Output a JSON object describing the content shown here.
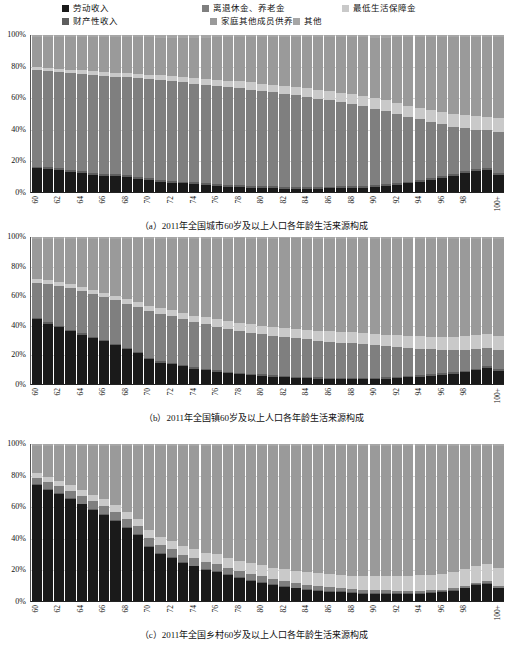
{
  "legend": {
    "items": [
      {
        "label": "劳动收入",
        "color": "#1a1a1a",
        "key": "labor"
      },
      {
        "label": "财产性收入",
        "color": "#5e5e5e",
        "key": "property"
      },
      {
        "label": "离退休金、养老金",
        "color": "#7f7f7f",
        "key": "pension"
      },
      {
        "label": "家庭其他成员供养",
        "color": "#9a9a9a",
        "key": "family"
      },
      {
        "label": "最低生活保障金",
        "color": "#c9c9c9",
        "key": "subsistence"
      },
      {
        "label": "其他",
        "color": "#a6a6a6",
        "key": "other"
      }
    ]
  },
  "axis": {
    "y_ticks": [
      "0%",
      "20%",
      "40%",
      "60%",
      "80%",
      "100%"
    ],
    "y_values": [
      0,
      20,
      40,
      60,
      80,
      100
    ],
    "x_ticks": [
      "60",
      "",
      "62",
      "",
      "64",
      "",
      "66",
      "",
      "68",
      "",
      "70",
      "",
      "72",
      "",
      "74",
      "",
      "76",
      "",
      "78",
      "",
      "80",
      "",
      "82",
      "",
      "84",
      "",
      "86",
      "",
      "88",
      "",
      "90",
      "",
      "92",
      "",
      "94",
      "",
      "96",
      "",
      "98",
      "",
      "",
      "100+"
    ]
  },
  "captions": {
    "a": "（a）2011年全国城市60岁及以上人口各年龄生活来源构成",
    "b": "（b）2011年全国镇60岁及以上人口各年龄生活来源构成",
    "c": "（c）2011年全国乡村60岁及以上人口各年龄生活来源构成"
  },
  "chart_data": [
    {
      "id": "a",
      "type": "bar",
      "stacked": true,
      "title": "（a）2011年全国城市60岁及以上人口各年龄生活来源构成",
      "xlabel": "",
      "ylabel": "",
      "ylim": [
        0,
        100
      ],
      "grid": true,
      "legend_position": "top",
      "categories": [
        "60",
        "61",
        "62",
        "63",
        "64",
        "65",
        "66",
        "67",
        "68",
        "69",
        "70",
        "71",
        "72",
        "73",
        "74",
        "75",
        "76",
        "77",
        "78",
        "79",
        "80",
        "81",
        "82",
        "83",
        "84",
        "85",
        "86",
        "87",
        "88",
        "89",
        "90",
        "91",
        "92",
        "93",
        "94",
        "95",
        "96",
        "97",
        "98",
        "99",
        "100",
        "100+"
      ],
      "series": [
        {
          "name": "劳动收入",
          "color": "#1a1a1a",
          "values": [
            15,
            14.5,
            14,
            13,
            12,
            11,
            10.5,
            10,
            9.5,
            8.5,
            7.5,
            6.5,
            6,
            5.5,
            5,
            4.5,
            4,
            3.5,
            3,
            2.8,
            2.6,
            2.4,
            2.2,
            2.2,
            2.2,
            2.2,
            2.3,
            2.5,
            2.6,
            2.8,
            3.2,
            3.8,
            4.5,
            5.5,
            6.5,
            7.5,
            9,
            10.5,
            12,
            13.5,
            14,
            11
          ]
        },
        {
          "name": "财产性收入",
          "color": "#5e5e5e",
          "values": [
            1.2,
            1.2,
            1.2,
            1.2,
            1.2,
            1.2,
            1.2,
            1.2,
            1.2,
            1.2,
            1.2,
            1.2,
            1.2,
            1.2,
            1.2,
            1.2,
            1.2,
            1.2,
            1.2,
            1.2,
            1.2,
            1.2,
            1.2,
            1.2,
            1.2,
            1.2,
            1.2,
            1.2,
            1.2,
            1.2,
            1.2,
            1.2,
            1.2,
            1.2,
            1.2,
            1.2,
            1.2,
            1.2,
            1.2,
            1.2,
            1.2,
            1.2
          ]
        },
        {
          "name": "离退休金、养老金",
          "color": "#7f7f7f",
          "values": [
            61.3,
            61.3,
            61.1,
            61.6,
            62.1,
            62.6,
            62.3,
            62.3,
            62.3,
            62.8,
            63.3,
            63.8,
            63.4,
            63.1,
            62.8,
            62.5,
            62.3,
            62.1,
            61.9,
            61.2,
            60.5,
            59.8,
            59.1,
            58.1,
            57.1,
            56.1,
            55.0,
            53.5,
            52.2,
            50.8,
            48.8,
            46.5,
            44.0,
            41.0,
            38.5,
            36.0,
            33.0,
            30.0,
            27.5,
            25.0,
            24.0,
            26.0
          ]
        },
        {
          "name": "最低生活保障金",
          "color": "#c9c9c9",
          "values": [
            2.0,
            2.0,
            2.2,
            2.2,
            2.2,
            2.2,
            2.4,
            2.5,
            2.6,
            2.7,
            2.8,
            3.0,
            3.2,
            3.4,
            3.6,
            3.8,
            4.0,
            4.2,
            4.4,
            4.6,
            4.8,
            5.0,
            5.2,
            5.4,
            5.6,
            5.8,
            6.0,
            6.2,
            6.4,
            6.6,
            6.8,
            7.0,
            7.2,
            7.4,
            7.6,
            7.8,
            8.0,
            8.2,
            8.4,
            8.6,
            8.8,
            9.0
          ]
        },
        {
          "name": "家庭其他成员供养",
          "color": "#9a9a9a",
          "values": [
            19.0,
            19.5,
            20.0,
            20.5,
            21.0,
            21.5,
            22.1,
            22.5,
            23.0,
            23.3,
            23.7,
            23.9,
            24.6,
            25.2,
            25.8,
            26.4,
            27.0,
            27.5,
            28.0,
            29.0,
            29.6,
            30.2,
            30.8,
            31.6,
            32.4,
            33.2,
            34.0,
            35.1,
            36.1,
            37.1,
            38.4,
            39.9,
            41.6,
            43.4,
            44.9,
            46.4,
            47.7,
            49.0,
            49.8,
            50.6,
            51.0,
            51.8
          ]
        },
        {
          "name": "其他",
          "color": "#a6a6a6",
          "values": [
            1.5,
            1.5,
            1.5,
            1.5,
            1.5,
            1.5,
            1.5,
            1.5,
            1.4,
            1.5,
            1.5,
            1.6,
            1.6,
            1.6,
            1.6,
            1.6,
            1.5,
            1.5,
            1.5,
            1.2,
            1.3,
            1.4,
            1.5,
            1.5,
            1.5,
            1.5,
            1.5,
            1.5,
            1.5,
            1.5,
            1.6,
            1.6,
            1.5,
            1.5,
            1.3,
            1.1,
            1.1,
            1.1,
            1.1,
            1.1,
            1.0,
            1.0
          ]
        }
      ]
    },
    {
      "id": "b",
      "type": "bar",
      "stacked": true,
      "title": "（b）2011年全国镇60岁及以上人口各年龄生活来源构成",
      "xlabel": "",
      "ylabel": "",
      "ylim": [
        0,
        100
      ],
      "grid": true,
      "legend_position": "top",
      "categories": [
        "60",
        "61",
        "62",
        "63",
        "64",
        "65",
        "66",
        "67",
        "68",
        "69",
        "70",
        "71",
        "72",
        "73",
        "74",
        "75",
        "76",
        "77",
        "78",
        "79",
        "80",
        "81",
        "82",
        "83",
        "84",
        "85",
        "86",
        "87",
        "88",
        "89",
        "90",
        "91",
        "92",
        "93",
        "94",
        "95",
        "96",
        "97",
        "98",
        "99",
        "100",
        "100+"
      ],
      "series": [
        {
          "name": "劳动收入",
          "color": "#1a1a1a",
          "values": [
            44,
            41,
            38.5,
            36,
            33.5,
            31,
            29,
            26.5,
            23.5,
            21,
            17,
            14.5,
            13.5,
            12,
            10.5,
            9.5,
            8.5,
            7.5,
            6.5,
            6,
            5.5,
            5,
            4.5,
            4,
            3.8,
            3.6,
            3.4,
            3.2,
            3.2,
            3.2,
            3.4,
            3.6,
            4.0,
            4.5,
            5.0,
            5.5,
            6.2,
            7.0,
            8.0,
            9.5,
            11,
            9
          ]
        },
        {
          "name": "财产性收入",
          "color": "#5e5e5e",
          "values": [
            1.0,
            1.0,
            1.0,
            1.0,
            1.0,
            1.0,
            1.0,
            1.0,
            1.0,
            1.0,
            1.0,
            1.0,
            1.0,
            1.0,
            1.0,
            1.0,
            1.0,
            1.0,
            1.0,
            1.0,
            1.0,
            1.0,
            1.0,
            1.0,
            1.0,
            1.0,
            1.0,
            1.0,
            1.0,
            1.0,
            1.0,
            1.0,
            1.0,
            1.0,
            1.0,
            1.0,
            1.0,
            1.0,
            1.0,
            1.0,
            1.0,
            1.0
          ]
        },
        {
          "name": "离退休金、养老金",
          "color": "#7f7f7f",
          "values": [
            24.0,
            26.0,
            27.0,
            28.0,
            28.5,
            29.0,
            29.0,
            29.5,
            30.0,
            30.5,
            31.5,
            32.0,
            31.5,
            31.0,
            30.5,
            30.0,
            29.5,
            29.0,
            28.5,
            28.0,
            27.5,
            27.0,
            26.5,
            26.0,
            25.5,
            25.0,
            24.5,
            24.0,
            23.5,
            23.0,
            22.0,
            21.0,
            20.0,
            19.0,
            18.0,
            17.0,
            16.0,
            15.0,
            14.0,
            13.0,
            12.5,
            13.0
          ]
        },
        {
          "name": "最低生活保障金",
          "color": "#c9c9c9",
          "values": [
            2.5,
            2.6,
            2.7,
            2.8,
            2.9,
            3.0,
            3.1,
            3.2,
            3.4,
            3.6,
            3.8,
            4.0,
            4.2,
            4.4,
            4.6,
            4.8,
            5.0,
            5.2,
            5.4,
            5.6,
            5.8,
            6.0,
            6.2,
            6.4,
            6.6,
            6.8,
            7.0,
            7.2,
            7.4,
            7.6,
            7.8,
            8.0,
            8.2,
            8.4,
            8.6,
            8.8,
            9.0,
            9.2,
            9.4,
            9.6,
            9.8,
            10.0
          ]
        },
        {
          "name": "家庭其他成员供养",
          "color": "#9a9a9a",
          "values": [
            27.0,
            28.0,
            29.5,
            30.8,
            32.8,
            34.6,
            36.5,
            38.5,
            41.0,
            43.0,
            45.6,
            47.4,
            48.7,
            50.5,
            52.3,
            53.6,
            55.0,
            56.3,
            57.6,
            58.4,
            59.2,
            60.0,
            60.8,
            61.6,
            62.1,
            62.6,
            63.1,
            63.6,
            63.9,
            64.2,
            64.7,
            65.3,
            65.7,
            66.0,
            66.3,
            66.6,
            66.7,
            66.7,
            66.5,
            65.8,
            64.6,
            65.9
          ]
        },
        {
          "name": "其他",
          "color": "#a6a6a6",
          "values": [
            1.5,
            1.4,
            1.3,
            1.4,
            1.3,
            1.4,
            1.4,
            1.3,
            1.1,
            0.9,
            1.1,
            1.1,
            1.1,
            1.1,
            1.1,
            1.1,
            1.0,
            1.0,
            1.0,
            1.0,
            1.0,
            1.0,
            1.0,
            1.0,
            1.0,
            1.0,
            1.0,
            1.0,
            1.0,
            1.0,
            1.1,
            1.1,
            1.1,
            1.1,
            1.1,
            1.1,
            1.1,
            1.1,
            1.1,
            1.1,
            1.1,
            1.1
          ]
        }
      ]
    },
    {
      "id": "c",
      "type": "bar",
      "stacked": true,
      "title": "（c）2011年全国乡村60岁及以上人口各年龄生活来源构成",
      "xlabel": "",
      "ylabel": "",
      "ylim": [
        0,
        100
      ],
      "grid": true,
      "legend_position": "top",
      "categories": [
        "60",
        "61",
        "62",
        "63",
        "64",
        "65",
        "66",
        "67",
        "68",
        "69",
        "70",
        "71",
        "72",
        "73",
        "74",
        "75",
        "76",
        "77",
        "78",
        "79",
        "80",
        "81",
        "82",
        "83",
        "84",
        "85",
        "86",
        "87",
        "88",
        "89",
        "90",
        "91",
        "92",
        "93",
        "94",
        "95",
        "96",
        "97",
        "98",
        "99",
        "100",
        "100+"
      ],
      "values_note": "stacked percentages sum to 100",
      "series": [
        {
          "name": "劳动收入",
          "color": "#1a1a1a",
          "values": [
            74,
            71,
            68,
            65,
            61.5,
            58,
            55,
            51,
            46.5,
            42,
            34.5,
            30,
            27.5,
            24,
            22,
            19.5,
            18.5,
            16.5,
            14.5,
            13,
            11.5,
            10,
            9,
            8,
            7,
            6.5,
            6,
            5.5,
            5,
            4.5,
            4.5,
            4.5,
            4.5,
            4.5,
            4.5,
            5,
            5.5,
            6.5,
            8,
            10,
            11,
            8
          ]
        },
        {
          "name": "财产性收入",
          "color": "#5e5e5e",
          "values": [
            0.6,
            0.6,
            0.6,
            0.6,
            0.6,
            0.6,
            0.6,
            0.6,
            0.6,
            0.6,
            0.6,
            0.6,
            0.6,
            0.6,
            0.6,
            0.6,
            0.6,
            0.6,
            0.6,
            0.6,
            0.6,
            0.6,
            0.6,
            0.6,
            0.6,
            0.6,
            0.6,
            0.6,
            0.6,
            0.6,
            0.6,
            0.6,
            0.6,
            0.6,
            0.6,
            0.6,
            0.6,
            0.6,
            0.6,
            0.6,
            0.6,
            0.6
          ]
        },
        {
          "name": "离退休金、养老金",
          "color": "#7f7f7f",
          "values": [
            4.0,
            4.2,
            4.4,
            4.6,
            4.8,
            5.0,
            5.0,
            5.0,
            5.0,
            5.0,
            5.0,
            5.0,
            5.0,
            5.0,
            4.8,
            4.6,
            4.4,
            4.2,
            4.0,
            3.8,
            3.6,
            3.4,
            3.2,
            3.0,
            2.8,
            2.6,
            2.4,
            2.2,
            2.0,
            1.9,
            1.8,
            1.7,
            1.6,
            1.5,
            1.4,
            1.3,
            1.2,
            1.1,
            1.0,
            1.0,
            1.0,
            1.0
          ]
        },
        {
          "name": "最低生活保障金",
          "color": "#c9c9c9",
          "values": [
            3.0,
            3.2,
            3.4,
            3.6,
            3.8,
            4.0,
            4.2,
            4.4,
            4.6,
            4.8,
            5.0,
            5.2,
            5.4,
            5.6,
            5.8,
            6.0,
            6.2,
            6.4,
            6.6,
            6.8,
            7.0,
            7.2,
            7.4,
            7.6,
            7.8,
            8.0,
            8.2,
            8.4,
            8.6,
            8.8,
            9.0,
            9.2,
            9.4,
            9.6,
            9.8,
            10.0,
            10.2,
            10.4,
            10.6,
            10.8,
            11.0,
            11.2
          ]
        },
        {
          "name": "家庭其他成员供养",
          "color": "#9a9a9a",
          "values": [
            17.0,
            19.6,
            22.2,
            24.8,
            28.0,
            31.1,
            34.0,
            37.8,
            42.1,
            46.4,
            53.7,
            58.1,
            60.4,
            63.7,
            65.7,
            68.2,
            69.2,
            71.2,
            73.2,
            74.7,
            76.2,
            77.7,
            78.7,
            79.7,
            80.7,
            81.2,
            81.7,
            82.2,
            82.7,
            83.1,
            83.0,
            82.9,
            82.8,
            82.7,
            82.6,
            82.0,
            81.4,
            80.3,
            78.7,
            76.5,
            75.3,
            78.1
          ]
        },
        {
          "name": "其他",
          "color": "#a6a6a6",
          "values": [
            1.4,
            1.4,
            1.4,
            1.4,
            1.3,
            1.3,
            1.2,
            1.2,
            1.2,
            1.2,
            1.2,
            1.1,
            1.1,
            1.1,
            1.1,
            1.1,
            1.1,
            1.1,
            1.1,
            1.1,
            1.1,
            1.1,
            1.1,
            1.1,
            1.1,
            1.1,
            1.1,
            1.1,
            1.1,
            1.1,
            1.1,
            1.1,
            1.1,
            1.1,
            1.1,
            1.1,
            1.1,
            1.1,
            1.1,
            1.1,
            1.1,
            1.1
          ]
        }
      ]
    }
  ],
  "layout": {
    "charts": [
      {
        "id": "a",
        "plot_top": 35,
        "plot_height": 158,
        "xlabels_top": 195,
        "caption_top": 219
      },
      {
        "id": "b",
        "plot_top": 237,
        "plot_height": 148,
        "xlabels_top": 387,
        "caption_top": 411
      },
      {
        "id": "c",
        "plot_top": 444,
        "plot_height": 158,
        "xlabels_top": 604,
        "caption_top": 628
      }
    ]
  }
}
